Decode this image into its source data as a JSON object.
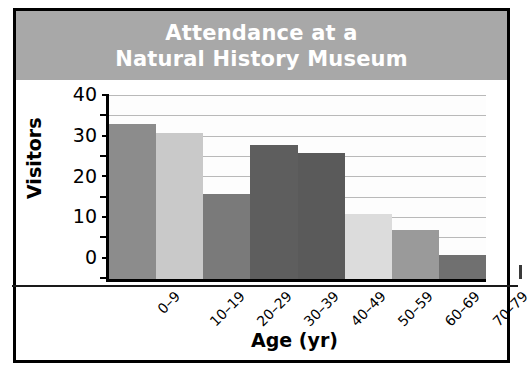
{
  "chart_data": {
    "type": "bar",
    "title": "Attendance at a Natural History Museum",
    "title_lines": [
      "Attendance at a",
      "Natural History Museum"
    ],
    "xlabel": "Age (yr)",
    "ylabel": "Visitors",
    "categories": [
      "0–9",
      "10–19",
      "20–29",
      "30–39",
      "40–49",
      "50–59",
      "60–69",
      "70–79"
    ],
    "values": [
      38,
      36,
      21,
      33,
      31,
      16,
      12,
      6
    ],
    "bar_colors": [
      "#8c8c8c",
      "#c9c9c9",
      "#7a7a7a",
      "#5e5e5e",
      "#5a5a5a",
      "#dcdcdc",
      "#9a9a9a",
      "#707070"
    ],
    "ylim": [
      0,
      45
    ],
    "ytick_labels": [
      "0",
      "10",
      "20",
      "30",
      "40"
    ],
    "ytick_values": [
      0,
      10,
      20,
      30,
      40
    ],
    "yminor_values": [
      5,
      15,
      25,
      35,
      45
    ],
    "grid": true,
    "gridline_values": [
      5,
      10,
      15,
      20,
      25,
      30,
      35,
      40,
      45
    ],
    "legend": "none",
    "legend_position": "none",
    "xtick_rotation_degrees": 45
  },
  "figure": {
    "banner_color": "#a8a8a8",
    "title_text_color": "#ffffff",
    "frame_color": "#000000",
    "background": "#ffffff",
    "gridline_color": "#b9b9b9"
  }
}
